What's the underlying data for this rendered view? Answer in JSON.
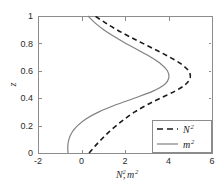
{
  "chart_data": {
    "type": "line",
    "title": "",
    "xlabel": "N², m²",
    "ylabel": "z",
    "xlim": [
      -2,
      6
    ],
    "ylim": [
      0,
      1
    ],
    "xticks": [
      -2,
      0,
      2,
      4,
      6
    ],
    "xticklabels": [
      "-2",
      "0",
      "2",
      "4",
      "6"
    ],
    "yticks": [
      0,
      0.2,
      0.4,
      0.6,
      0.8,
      1
    ],
    "yticklabels": [
      "0",
      "0.2",
      "0.4",
      "0.6",
      "0.8",
      "1"
    ],
    "grid": false,
    "legend_position": "lower right",
    "orientation": "vertical-profile",
    "series": [
      {
        "name": "N²",
        "name_base": "N",
        "name_sup": "2",
        "style": "dashed",
        "color": "#1a1a1a",
        "width": 1.6,
        "z": [
          0.0,
          0.05,
          0.1,
          0.15,
          0.2,
          0.25,
          0.3,
          0.35,
          0.4,
          0.45,
          0.5,
          0.55,
          0.6,
          0.65,
          0.7,
          0.75,
          0.8,
          0.85,
          0.9,
          0.95,
          1.0
        ],
        "x": [
          0.35,
          0.62,
          0.92,
          1.24,
          1.6,
          2.0,
          2.45,
          3.0,
          3.62,
          4.28,
          4.78,
          5.0,
          4.92,
          4.58,
          4.05,
          3.45,
          2.82,
          2.2,
          1.62,
          1.1,
          0.62
        ]
      },
      {
        "name": "m²",
        "name_base": "m",
        "name_sup": "2",
        "style": "solid",
        "color": "#808080",
        "width": 1.2,
        "z": [
          0.0,
          0.05,
          0.1,
          0.15,
          0.2,
          0.25,
          0.3,
          0.35,
          0.4,
          0.45,
          0.5,
          0.55,
          0.6,
          0.65,
          0.7,
          0.75,
          0.8,
          0.85,
          0.9,
          0.95,
          1.0
        ],
        "x": [
          -0.62,
          -0.63,
          -0.58,
          -0.44,
          -0.18,
          0.22,
          0.8,
          1.55,
          2.42,
          3.26,
          3.82,
          4.02,
          3.95,
          3.65,
          3.18,
          2.62,
          2.04,
          1.5,
          1.02,
          0.62,
          0.3
        ]
      }
    ]
  },
  "axes": {
    "y_axis_label": "z",
    "x_axis_label_base": "N",
    "x_axis_label_sup": "2",
    "x_axis_label_base2": "m",
    "x_axis_label_sup2": "2",
    "x_axis_label_comma": ","
  },
  "legend": {
    "entries": [
      {
        "label_base": "N",
        "label_sup": "2",
        "style": "dashed"
      },
      {
        "label_base": "m",
        "label_sup": "2",
        "style": "solid"
      }
    ]
  },
  "geometry": {
    "plot_left": 38,
    "plot_right": 212,
    "plot_top": 16,
    "plot_bottom": 153,
    "legend_left": 152,
    "legend_right": 211,
    "legend_top": 120,
    "legend_bottom": 152
  },
  "colors": {
    "frame": "#8c8c8c",
    "dashed_series": "#1a1a1a",
    "solid_series": "#808080",
    "text": "#2b2b2b",
    "background": "#ffffff"
  }
}
